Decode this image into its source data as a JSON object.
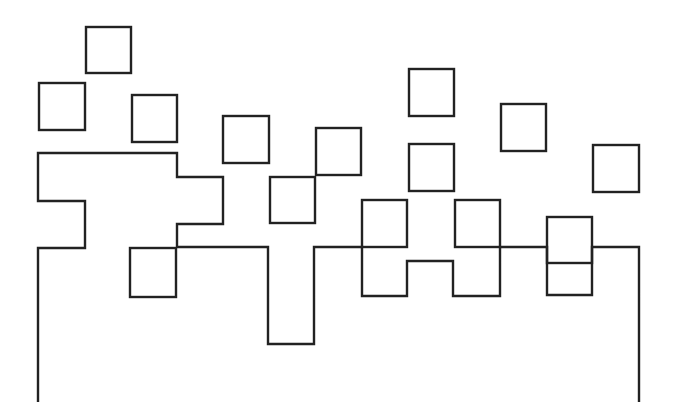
{
  "diagram": {
    "width": 676,
    "height": 402,
    "background": "#ffffff",
    "stroke_color": "#222222",
    "outline": {
      "points": [
        [
          38,
          402
        ],
        [
          38,
          248
        ],
        [
          85,
          248
        ],
        [
          85,
          201
        ],
        [
          38,
          201
        ],
        [
          38,
          153
        ],
        [
          177,
          153
        ],
        [
          177,
          177
        ],
        [
          223,
          177
        ],
        [
          223,
          224
        ],
        [
          177,
          224
        ],
        [
          177,
          247
        ],
        [
          268,
          247
        ],
        [
          268,
          344
        ],
        [
          314,
          344
        ],
        [
          314,
          247
        ],
        [
          362,
          247
        ],
        [
          362,
          296
        ],
        [
          407,
          296
        ],
        [
          407,
          261
        ],
        [
          453,
          261
        ],
        [
          453,
          296
        ],
        [
          500,
          296
        ],
        [
          500,
          247
        ],
        [
          547,
          247
        ],
        [
          547,
          295
        ],
        [
          592,
          295
        ],
        [
          592,
          247
        ],
        [
          639,
          247
        ],
        [
          639,
          402
        ]
      ]
    },
    "squares": [
      {
        "x": 86,
        "y": 27,
        "w": 45,
        "h": 46
      },
      {
        "x": 39,
        "y": 83,
        "w": 46,
        "h": 47
      },
      {
        "x": 132,
        "y": 95,
        "w": 45,
        "h": 47
      },
      {
        "x": 223,
        "y": 116,
        "w": 46,
        "h": 47
      },
      {
        "x": 316,
        "y": 128,
        "w": 45,
        "h": 47
      },
      {
        "x": 270,
        "y": 177,
        "w": 45,
        "h": 46
      },
      {
        "x": 409,
        "y": 69,
        "w": 45,
        "h": 47
      },
      {
        "x": 501,
        "y": 104,
        "w": 45,
        "h": 47
      },
      {
        "x": 409,
        "y": 144,
        "w": 45,
        "h": 47
      },
      {
        "x": 593,
        "y": 145,
        "w": 46,
        "h": 47
      },
      {
        "x": 130,
        "y": 248,
        "w": 46,
        "h": 49
      },
      {
        "x": 362,
        "y": 200,
        "w": 45,
        "h": 47
      },
      {
        "x": 455,
        "y": 200,
        "w": 45,
        "h": 47
      },
      {
        "x": 547,
        "y": 217,
        "w": 45,
        "h": 46
      }
    ]
  }
}
